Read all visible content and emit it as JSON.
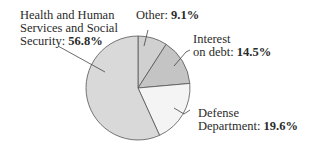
{
  "chart_data": {
    "type": "pie",
    "title": "",
    "slices": [
      {
        "label": "Health and Human Services and Social Security",
        "value": 56.8,
        "display": "56.8%",
        "color": "#d9d9d9"
      },
      {
        "label": "Other",
        "value": 9.1,
        "display": "9.1%",
        "color": "#d0d0d0"
      },
      {
        "label": "Interest on debt",
        "value": 14.5,
        "display": "14.5%",
        "color": "#c4c4c4"
      },
      {
        "label": "Defense Department",
        "value": 19.6,
        "display": "19.6%",
        "color": "#f4f4f4"
      }
    ],
    "legend": "none (callout labels)"
  },
  "labels": {
    "hhs_line1": "Health and Human",
    "hhs_line2": "Services and Social",
    "hhs_line3": "Security:",
    "hhs_value": "56.8%",
    "other_name": "Other:",
    "other_value": "9.1%",
    "interest_line1": "Interest",
    "interest_line2": "on debt:",
    "interest_value": "14.5%",
    "defense_line1": "Defense",
    "defense_line2": "Department:",
    "defense_value": "19.6%"
  }
}
